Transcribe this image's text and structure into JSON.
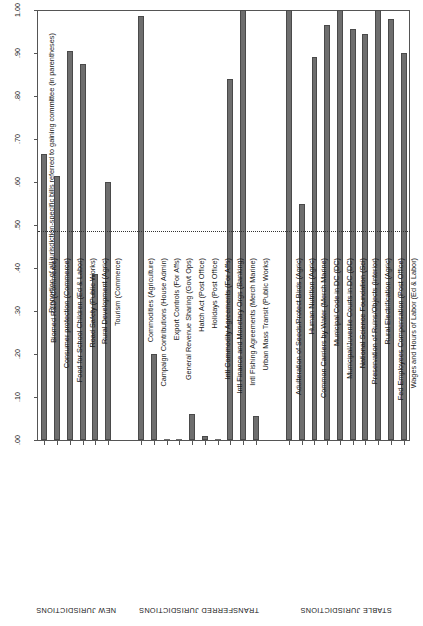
{
  "chart_data": {
    "type": "bar",
    "title": "",
    "xlabel": "",
    "ylabel": "Proportion of all jurisdiction-specific bills referred to gaining committee (in parentheses)",
    "ylim": [
      0.0,
      1.0
    ],
    "ytick_labels": [
      "1.00",
      ".90",
      ".80",
      ".70",
      ".60",
      ".50",
      ".40",
      ".30",
      ".20",
      ".10",
      ".00"
    ],
    "ytick_values": [
      1.0,
      0.9,
      0.8,
      0.7,
      0.6,
      0.5,
      0.4,
      0.3,
      0.2,
      0.1,
      0.0
    ],
    "grid": false,
    "legend": "none",
    "reference_line": {
      "value": 0.485,
      "style": "dotted",
      "label": ""
    },
    "bar_color": "#6e6e6e",
    "bar_edge_color": "#4a4a4a",
    "categories": [
      "Biomed R&D (Commerce)",
      "Consumer protection (Commerce)",
      "Food for School Children (Ed & Labor)",
      "Road Safety (Public Works)",
      "Rural Development (Agric)",
      "Tourism (Commerce)",
      "Commodities (Agriculture)",
      "Campaign Contributions (House Admin)",
      "Export Controls (For Affs)",
      "General Revenue Sharing (Govt Ops)",
      "Hatch Act (Post Office)",
      "Holidays (Post Office)",
      "Intl Commodity Agreements (For Affs)",
      "Intl Finance and Monetary Orgs (Banking)",
      "Intl Fishing Agreements (Merch Marine)",
      "Urban Mass Transit (Public Works)",
      "Adulteration of Seeds/Protect Birds (Agric)",
      "Human Nutrition (Agric)",
      "Common Carriers by Water (Merch Marine)",
      "Municipal Code in DC (DC)",
      "Municipal/Juvenile Courts in DC (DC)",
      "National Science Foundation (Sci)",
      "Preservation of Ruins/Objects (Interior)",
      "Rural Electrification (Agric)",
      "Fed Employees Compensation (Post Office)",
      "Wages and Hours of Labor (Ed & Labor)"
    ],
    "values": [
      0.665,
      0.615,
      0.905,
      0.875,
      0.385,
      0.6,
      0.985,
      0.2,
      0.0,
      0.0,
      0.06,
      0.01,
      0.0,
      0.84,
      1.0,
      0.055,
      1.0,
      0.55,
      0.89,
      0.965,
      1.0,
      0.955,
      0.945,
      1.0,
      0.98,
      0.9
    ],
    "groups": [
      {
        "label": "NEW JURISDICTIONS",
        "start": 0,
        "count": 6
      },
      {
        "label": "TRANSFERRED JURISDICTIONS",
        "start": 6,
        "count": 10
      },
      {
        "label": "STABLE JURISDICTIONS",
        "start": 16,
        "count": 10
      }
    ]
  }
}
